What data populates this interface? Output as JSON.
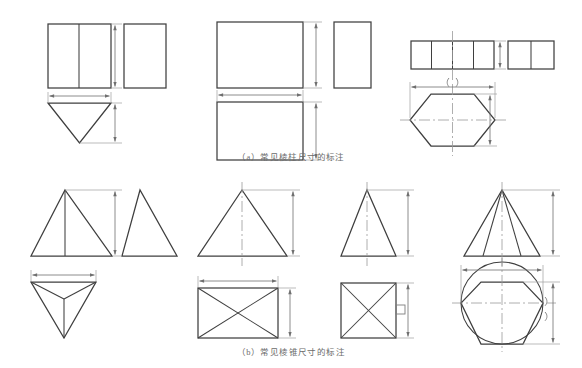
{
  "figure": {
    "kind": "engineering-drawing",
    "title_visible": false,
    "background_color": "#ffffff",
    "line_color": "#3f3f3f",
    "centerline_color": "#8a8a8a",
    "dimension_color": "#6f6f6f",
    "caption_color": "#6b6b6b"
  },
  "captions": {
    "a": "（a）常见棱柱尺寸的标注",
    "b": "（b）常见棱锥尺寸的标注"
  },
  "panel_a": {
    "label": "a",
    "groups": [
      {
        "name": "triangular-prism",
        "front_view": {
          "shape": "rectangle",
          "internal_vertical_lines": 1
        },
        "side_view": {
          "shape": "rectangle",
          "internal_vertical_lines": 0
        },
        "top_view": {
          "shape": "triangle-down",
          "internal_lines": 0
        },
        "dimensions": [
          "height-vertical-right",
          "width-horizontal-top"
        ]
      },
      {
        "name": "rectangular-prism",
        "front_view": {
          "shape": "rectangle",
          "internal_vertical_lines": 0
        },
        "side_view": {
          "shape": "rectangle",
          "internal_vertical_lines": 0
        },
        "top_view": {
          "shape": "rectangle",
          "internal_lines": 0
        },
        "dimensions": [
          "height-vertical-right",
          "width-horizontal-top",
          "depth-vertical-right"
        ]
      },
      {
        "name": "hexagonal-prism",
        "front_view": {
          "shape": "rectangle",
          "internal_vertical_lines": 3,
          "centerline": "vertical"
        },
        "side_view": {
          "shape": "rectangle",
          "internal_vertical_lines": 1
        },
        "top_view": {
          "shape": "hexagon",
          "centerlines": [
            "vertical",
            "horizontal"
          ]
        },
        "dimensions": [
          "height-vertical-right",
          "across-flats-horizontal-top",
          "depth-vertical-right"
        ],
        "annotation_symbol": "()"
      }
    ]
  },
  "panel_b": {
    "label": "b",
    "groups": [
      {
        "name": "triangular-pyramid",
        "front_view": {
          "shape": "triangle-up",
          "internal_lines": 1
        },
        "side_view": {
          "shape": "triangle-up",
          "internal_lines": 0
        },
        "top_view": {
          "shape": "triangle-down",
          "internal_lines": 3
        },
        "dimensions": [
          "height-vertical-right",
          "width-horizontal-top"
        ]
      },
      {
        "name": "rectangular-pyramid",
        "front_view": {
          "shape": "triangle-up",
          "centerline": "vertical"
        },
        "top_view": {
          "shape": "rectangle",
          "internal_lines": "diagonals-x"
        },
        "dimensions": [
          "height-vertical-right",
          "width-horizontal-top",
          "depth-vertical-right"
        ]
      },
      {
        "name": "square-pyramid",
        "front_view": {
          "shape": "triangle-up",
          "centerline": "vertical"
        },
        "top_view": {
          "shape": "square",
          "internal_lines": "diagonals-x"
        },
        "dimensions": [
          "height-vertical-right",
          "side-vertical-right"
        ],
        "annotation_symbol": "□"
      },
      {
        "name": "hexagonal-pyramid",
        "front_view": {
          "shape": "triangle-up",
          "internal_lines": 2,
          "centerline": "vertical"
        },
        "top_view": {
          "shape": "hexagon-in-circle",
          "centerlines": [
            "vertical",
            "horizontal"
          ]
        },
        "dimensions": [
          "height-vertical-right",
          "across-corners-horizontal-top",
          "across-flats-vertical-right"
        ],
        "annotation_symbol": "()"
      }
    ]
  }
}
